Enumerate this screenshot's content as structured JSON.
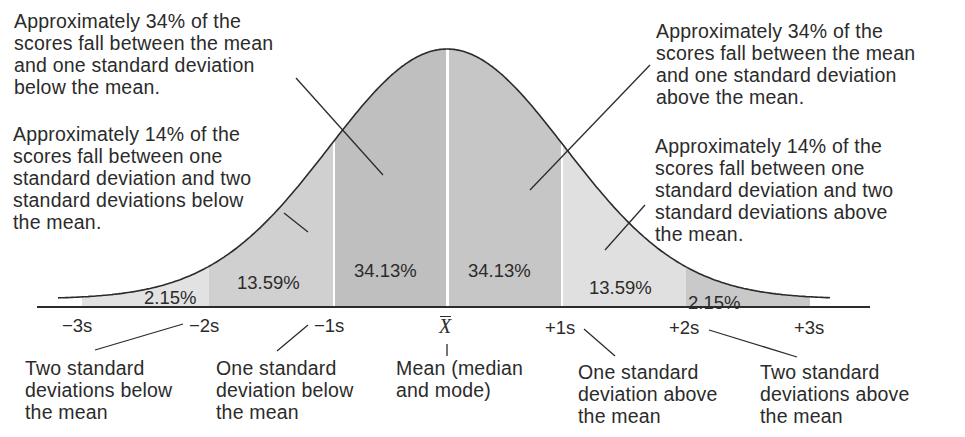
{
  "chart_data": {
    "type": "area",
    "title": "",
    "xlabel": "",
    "ylabel": "",
    "x_ticks": [
      "−3s",
      "−2s",
      "−1s",
      "X̄",
      "+1s",
      "+2s",
      "+3s"
    ],
    "bands": [
      {
        "from": "−3s",
        "to": "−2s",
        "percent": 2.15
      },
      {
        "from": "−2s",
        "to": "−1s",
        "percent": 13.59
      },
      {
        "from": "−1s",
        "to": "X̄",
        "percent": 34.13
      },
      {
        "from": "X̄",
        "to": "+1s",
        "percent": 34.13
      },
      {
        "from": "+1s",
        "to": "+2s",
        "percent": 13.59
      },
      {
        "from": "+2s",
        "to": "+3s",
        "percent": 2.15
      }
    ],
    "grid": false,
    "legend": "none"
  },
  "bands": {
    "b1": "2.15%",
    "b2": "13.59%",
    "b3": "34.13%",
    "b4": "34.13%",
    "b5": "13.59%",
    "b6": "2.15%"
  },
  "ticks": {
    "m3": "−3s",
    "m2": "−2s",
    "m1": "−1s",
    "mean": "X",
    "p1": "+1s",
    "p2": "+2s",
    "p3": "+3s"
  },
  "annotations": {
    "top_left_34": "Approximately 34% of the\nscores fall between the mean\nand one standard deviation\nbelow the mean.",
    "mid_left_14": "Approximately 14% of the\nscores fall between one\nstandard deviation and two\nstandard deviations below\nthe mean.",
    "top_right_34": "Approximately 34% of the\nscores fall between the mean\nand one standard deviation\nabove the mean.",
    "mid_right_14": "Approximately 14% of the\nscores fall between one\nstandard deviation and two\nstandard deviations above\nthe mean.",
    "below_m2": "Two standard\ndeviations below\nthe mean",
    "below_m1": "One standard\ndeviation below\nthe mean",
    "below_mean": "Mean (median\nand mode)",
    "below_p1": "One standard\ndeviation above\nthe mean",
    "below_p2": "Two standard\ndeviations above\nthe mean"
  },
  "colors": {
    "band_outer_left": "#e2e2e2",
    "band_13_left": "#d0d0d0",
    "band_34_left": "#bfbfbf",
    "band_34_right": "#c6c6c6",
    "band_13_right": "#e0e0e0",
    "band_outer_right": "#c9c9c9",
    "line": "#2b2b2b"
  }
}
